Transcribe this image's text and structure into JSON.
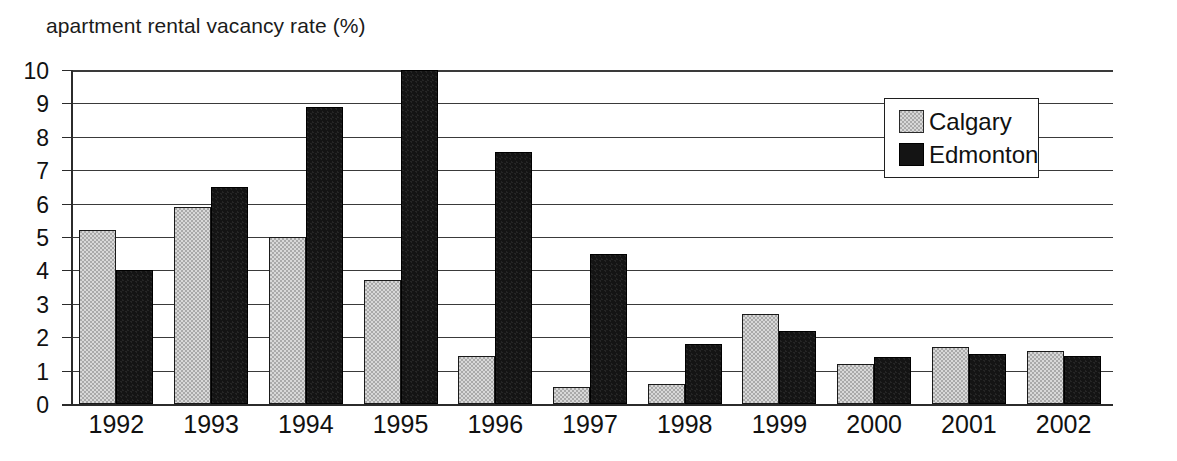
{
  "chart_data": {
    "type": "bar",
    "title": "apartment rental vacancy rate (%)",
    "xlabel": "",
    "ylabel": "",
    "ylim": [
      0,
      10
    ],
    "yticks": [
      "0",
      "1",
      "2",
      "3",
      "4",
      "5",
      "6",
      "7",
      "8",
      "9",
      "10"
    ],
    "ytick_values": [
      0,
      1,
      2,
      3,
      4,
      5,
      6,
      7,
      8,
      9,
      10
    ],
    "grid": true,
    "legend_position": "top-right",
    "categories": [
      "1992",
      "1993",
      "1994",
      "1995",
      "1996",
      "1997",
      "1998",
      "1999",
      "2000",
      "2001",
      "2002"
    ],
    "series": [
      {
        "name": "Calgary",
        "color": "#a9a9a9",
        "values": [
          5.2,
          5.9,
          5.0,
          3.7,
          1.45,
          0.5,
          0.6,
          2.7,
          1.2,
          1.7,
          1.6
        ]
      },
      {
        "name": "Edmonton",
        "color": "#141414",
        "values": [
          4.0,
          6.5,
          8.9,
          10.0,
          7.55,
          4.5,
          1.8,
          2.2,
          1.4,
          1.5,
          1.45
        ]
      }
    ]
  },
  "legend": {
    "entries": [
      {
        "label": "Calgary",
        "swatch": "gray-swatch"
      },
      {
        "label": "Edmonton",
        "swatch": "black-swatch"
      }
    ]
  }
}
